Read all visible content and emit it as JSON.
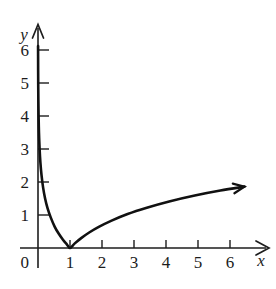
{
  "caption": {
    "prefix": "Asymptote: ",
    "equation": "x  =  0",
    "full": "Asymptote:  x  =  0"
  },
  "axes": {
    "x_name": "x",
    "y_name": "y",
    "origin_label": "0",
    "x_ticks": [
      "1",
      "2",
      "3",
      "4",
      "5",
      "6"
    ],
    "y_ticks": [
      "1",
      "2",
      "3",
      "4",
      "5",
      "6"
    ]
  },
  "chart_data": {
    "type": "line",
    "title": "Asymptote: x = 0",
    "xlabel": "x",
    "ylabel": "y",
    "xlim": [
      0,
      6.9
    ],
    "ylim": [
      0,
      6.8
    ],
    "grid": false,
    "legend": null,
    "annotations": [
      {
        "text": "Asymptote: x = 0",
        "kind": "vertical-asymptote",
        "at_x": 0
      },
      {
        "text": "minimum touches x-axis at (1, 0)",
        "kind": "minimum",
        "at_x": 1,
        "at_y": 0
      }
    ],
    "xticks": [
      0,
      1,
      2,
      3,
      4,
      5,
      6
    ],
    "yticks": [
      1,
      2,
      3,
      4,
      5,
      6
    ],
    "series": [
      {
        "name": "y = |ln x|",
        "x": [
          0.0022,
          0.003,
          0.0045,
          0.007,
          0.011,
          0.018,
          0.03,
          0.05,
          0.075,
          0.11,
          0.16,
          0.22,
          0.3,
          0.4,
          0.52,
          0.65,
          0.78,
          0.9,
          1.0,
          1.15,
          1.35,
          1.6,
          1.9,
          2.3,
          2.8,
          3.4,
          4.1,
          4.9,
          5.7,
          6.45
        ],
        "y": [
          6.12,
          5.81,
          5.4,
          4.96,
          4.51,
          4.02,
          3.51,
          3.0,
          2.59,
          2.21,
          1.83,
          1.51,
          1.2,
          0.92,
          0.65,
          0.43,
          0.25,
          0.11,
          0.0,
          0.14,
          0.3,
          0.47,
          0.64,
          0.83,
          1.03,
          1.22,
          1.41,
          1.59,
          1.74,
          1.86
        ]
      }
    ]
  }
}
